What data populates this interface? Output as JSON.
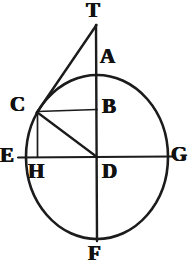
{
  "figure": {
    "kind": "geometric-diagram",
    "background_color": "#ffffff",
    "ink_color": "#1a1a1a",
    "width": 193,
    "height": 273
  },
  "labels": {
    "T": "T",
    "A": "A",
    "B": "B",
    "C": "C",
    "D": "D",
    "E": "E",
    "F": "F",
    "G": "G",
    "H": "H"
  },
  "geometry": {
    "circle": {
      "center_x": 97,
      "center_y": 157,
      "radius_x": 71,
      "radius_y": 82
    },
    "points": {
      "T": {
        "x": 96,
        "y": 25,
        "label_x": 86,
        "label_y": 0
      },
      "A": {
        "x": 97,
        "y": 75,
        "label_x": 100,
        "label_y": 46
      },
      "B": {
        "x": 97,
        "y": 110,
        "label_x": 102,
        "label_y": 96
      },
      "C": {
        "x": 37,
        "y": 112,
        "label_x": 10,
        "label_y": 94
      },
      "D": {
        "x": 97,
        "y": 157,
        "label_x": 102,
        "label_y": 161
      },
      "E": {
        "x": 26,
        "y": 157,
        "label_x": 0,
        "label_y": 145
      },
      "F": {
        "x": 97,
        "y": 239,
        "label_x": 88,
        "label_y": 243
      },
      "G": {
        "x": 168,
        "y": 157,
        "label_x": 171,
        "label_y": 144
      },
      "H": {
        "x": 37,
        "y": 157,
        "label_x": 28,
        "label_y": 161
      }
    },
    "segments": [
      {
        "name": "vertical-diameter-T-F",
        "x1": 96,
        "y1": 25,
        "x2": 97,
        "y2": 241
      },
      {
        "name": "horizontal-diameter-E-G",
        "x1": 18,
        "y1": 157,
        "x2": 172,
        "y2": 157
      },
      {
        "name": "tangent-T-C",
        "x1": 96,
        "y1": 25,
        "x2": 36,
        "y2": 113
      },
      {
        "name": "perpendicular-C-B",
        "x1": 37,
        "y1": 111,
        "x2": 97,
        "y2": 109
      },
      {
        "name": "radius-C-D",
        "x1": 37,
        "y1": 112,
        "x2": 97,
        "y2": 157
      },
      {
        "name": "perpendicular-C-H",
        "x1": 37,
        "y1": 112,
        "x2": 37,
        "y2": 157
      }
    ]
  },
  "label_styles": {
    "T": {
      "size": 21
    },
    "A": {
      "size": 21
    },
    "B": {
      "size": 21
    },
    "C": {
      "size": 21
    },
    "D": {
      "size": 21
    },
    "E": {
      "size": 21
    },
    "F": {
      "size": 21
    },
    "G": {
      "size": 21
    },
    "H": {
      "size": 21
    }
  }
}
